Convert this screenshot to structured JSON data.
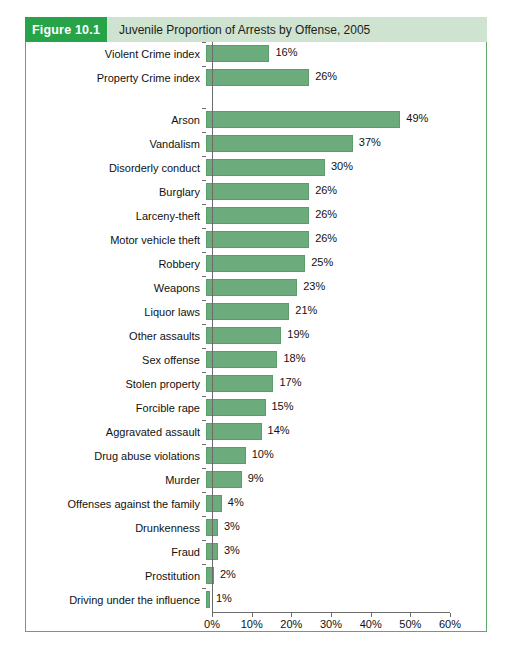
{
  "figure": {
    "tag": "Figure 10.1",
    "title": "Juvenile Proportion of Arrests by Offense, 2005",
    "tag_color": "#27a34a",
    "title_band_color": "#cfe3d1",
    "frame_color": "#5fa86a",
    "bar_color": "#6cab7b"
  },
  "chart_data": {
    "type": "bar",
    "orientation": "horizontal",
    "title": "Juvenile Proportion of Arrests by Offense, 2005",
    "xlabel": "",
    "ylabel": "",
    "xlim": [
      0,
      60
    ],
    "xticks": [
      0,
      10,
      20,
      30,
      40,
      50,
      60
    ],
    "xticklabels": [
      "0%",
      "10%",
      "20%",
      "30%",
      "40%",
      "50%",
      "60%"
    ],
    "grid": false,
    "legend": null,
    "value_suffix": "%",
    "groups": [
      {
        "name": "index",
        "categories": [
          "Violent Crime index",
          "Property Crime index"
        ],
        "values": [
          16,
          26
        ],
        "labels": [
          "16%",
          "26%"
        ]
      },
      {
        "name": "offenses",
        "categories": [
          "Arson",
          "Vandalism",
          "Disorderly conduct",
          "Burglary",
          "Larceny-theft",
          "Motor vehicle theft",
          "Robbery",
          "Weapons",
          "Liquor laws",
          "Other assaults",
          "Sex offense",
          "Stolen property",
          "Forcible rape",
          "Aggravated assault",
          "Drug abuse violations",
          "Murder",
          "Offenses against the family",
          "Drunkenness",
          "Fraud",
          "Prostitution",
          "Driving under the influence"
        ],
        "values": [
          49,
          37,
          30,
          26,
          26,
          26,
          25,
          23,
          21,
          19,
          18,
          17,
          15,
          14,
          10,
          9,
          4,
          3,
          3,
          2,
          1
        ],
        "labels": [
          "49%",
          "37%",
          "30%",
          "26%",
          "26%",
          "26%",
          "25%",
          "23%",
          "21%",
          "19%",
          "18%",
          "17%",
          "15%",
          "14%",
          "10%",
          "9%",
          "4%",
          "3%",
          "3%",
          "2%",
          "1%"
        ]
      }
    ]
  }
}
